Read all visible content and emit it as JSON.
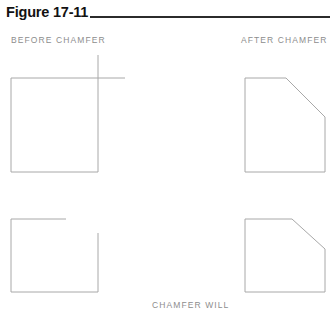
{
  "figure": {
    "title": "Figure 17-11",
    "caption_before": "BEFORE CHAMFER",
    "caption_after": "AFTER CHAMFER",
    "caption_bottom": "CHAMFER WILL"
  },
  "colors": {
    "title_text": "#121212",
    "rule": "#2b2b2b",
    "caption_text": "#8d8d8d",
    "drawing_line": "#a8a8a8",
    "background": "#ffffff"
  },
  "diagram": {
    "type": "technical-line-drawing",
    "panels": [
      {
        "name": "top-left-before",
        "label": "BEFORE CHAMFER",
        "row": "top",
        "shape": "square-with-overrunning-corner-lines",
        "note": "Square with the top edge line and the right edge line extended past the corner so they cross."
      },
      {
        "name": "top-right-after",
        "label": "AFTER CHAMFER",
        "row": "top",
        "shape": "square-with-chamfered-top-right-corner",
        "note": "Same square after chamfering; the top-right corner is replaced by a 45 degree bevel."
      },
      {
        "name": "bottom-left-before",
        "label": "BEFORE CHAMFER",
        "row": "bottom",
        "shape": "square-with-open-corner-gap",
        "note": "Square whose top edge and right edge stop short, leaving an open gap at the top-right corner."
      },
      {
        "name": "bottom-right-after",
        "label": "AFTER CHAMFER",
        "row": "bottom",
        "shape": "square-with-chamfered-top-right-corner",
        "note": "Open-corner square after chamfering; lines are extended and trimmed to the 45 degree bevel."
      }
    ]
  }
}
